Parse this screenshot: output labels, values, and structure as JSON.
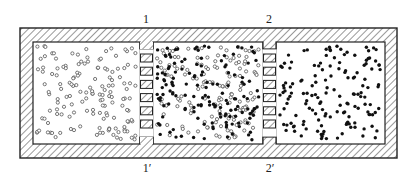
{
  "diagram": {
    "title": "",
    "colors": {
      "stroke": "#222222",
      "background": "#ffffff",
      "open_particle": "#555555",
      "filled_particle": "#111111"
    },
    "labels": {
      "top_1": "1",
      "top_2": "2",
      "bottom_1": "1′",
      "bottom_2": "2′"
    },
    "chambers": [
      {
        "name": "left",
        "particles": "open circles only"
      },
      {
        "name": "middle",
        "particles": "mixture of open and filled circles"
      },
      {
        "name": "right",
        "particles": "filled circles only"
      }
    ],
    "partitions": [
      {
        "name": "partition-1",
        "top_label": "1",
        "bottom_label": "1′",
        "slats": 6
      },
      {
        "name": "partition-2",
        "top_label": "2",
        "bottom_label": "2′",
        "slats": 6
      }
    ]
  }
}
